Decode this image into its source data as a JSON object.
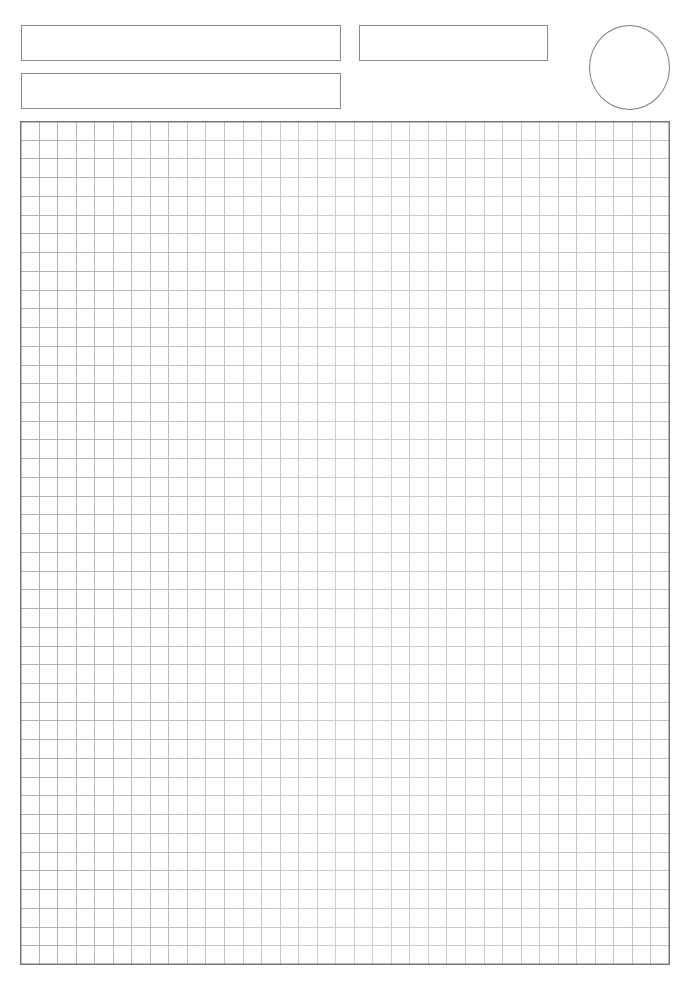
{
  "page": {
    "type": "grid-paper-template",
    "width": 696,
    "height": 985
  },
  "header": {
    "fields": [
      {
        "id": "field-1",
        "value": ""
      },
      {
        "id": "field-2",
        "value": ""
      },
      {
        "id": "field-3",
        "value": ""
      }
    ],
    "circle_mark": {
      "value": ""
    }
  },
  "grid": {
    "columns": 35,
    "rows": 45,
    "width": 649,
    "height": 843,
    "colors": {
      "border": "#777777",
      "line_left": "#b0b0b0",
      "line_center": "#cfcfcf",
      "line_right": "#c4c4c4",
      "box_border": "#8a8a8a"
    }
  }
}
